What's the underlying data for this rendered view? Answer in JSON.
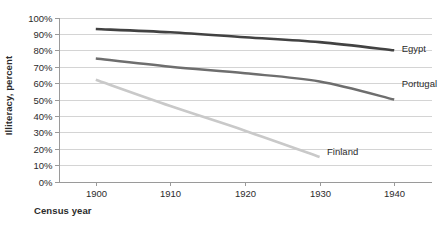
{
  "chart_data": {
    "type": "line",
    "title": "",
    "xlabel": "Census year",
    "ylabel": "Illiteracy, percent",
    "x": [
      1900,
      1910,
      1920,
      1930,
      1940
    ],
    "xlim": [
      1895,
      1945
    ],
    "ylim": [
      0,
      100
    ],
    "grid": true,
    "legend_position": "inline-right-of-series",
    "x_tick_labels": [
      "1900",
      "1910",
      "1920",
      "1930",
      "1940"
    ],
    "y_tick_labels": [
      "0%",
      "10%",
      "20%",
      "30%",
      "40%",
      "50%",
      "60%",
      "70%",
      "80%",
      "90%",
      "100%"
    ],
    "y_tick_values": [
      0,
      10,
      20,
      30,
      40,
      50,
      60,
      70,
      80,
      90,
      100
    ],
    "series": [
      {
        "name": "Egypt",
        "color": "#424242",
        "width": 2.6,
        "x": [
          1900,
          1910,
          1920,
          1930,
          1940
        ],
        "values": [
          93,
          91,
          88,
          85,
          80
        ],
        "label_x": 1941,
        "label_y": 81
      },
      {
        "name": "Portugal",
        "color": "#6e6e6e",
        "width": 2.4,
        "x": [
          1900,
          1910,
          1920,
          1930,
          1940
        ],
        "values": [
          75,
          70,
          66,
          61,
          50
        ],
        "label_x": 1941,
        "label_y": 60
      },
      {
        "name": "Finland",
        "color": "#c9c9c9",
        "width": 2.6,
        "x": [
          1900,
          1910,
          1920,
          1930
        ],
        "values": [
          62,
          46,
          31,
          15
        ],
        "label_x": 1931,
        "label_y": 18
      }
    ]
  },
  "axis": {
    "y_title": "Illiteracy, percent",
    "x_title": "Census year"
  }
}
